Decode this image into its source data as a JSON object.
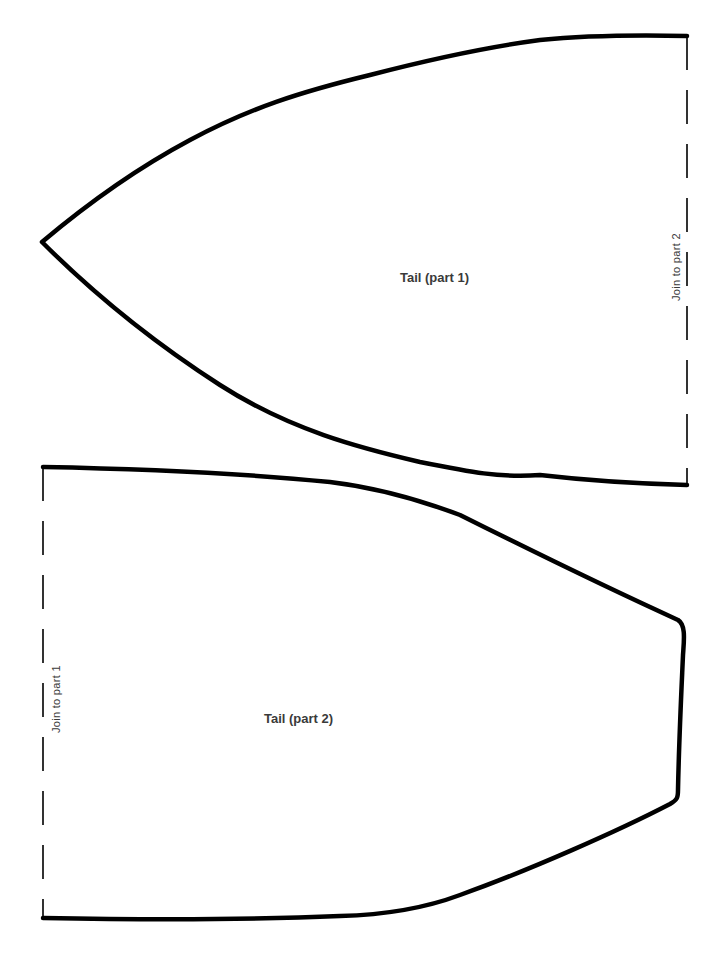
{
  "document": {
    "type": "sewing pattern template",
    "background_color": "#ffffff",
    "outline_color": "#000000",
    "text_color": "#3a3a3a"
  },
  "pieces": [
    {
      "label": "Tail (part 1)",
      "join_label": "Join to part 2",
      "join_edge": "right (dashed)"
    },
    {
      "label": "Tail (part 2)",
      "join_label": "Join to part 1",
      "join_edge": "left (dashed)"
    }
  ]
}
